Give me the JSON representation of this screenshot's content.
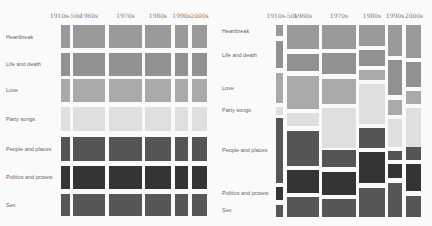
{
  "colors": {
    "Heartbreak": "#9a9a9a",
    "Life and death": "#919191",
    "Love": "#a9a9a9",
    "Party songs": "#dfdfdf",
    "People and places": "#555555",
    "Politics and protest": "#343434",
    "Sex": "#575757"
  },
  "chart_data": [
    {
      "type": "mosaic",
      "title": "",
      "categories": [
        "1910s-50s",
        "1960s",
        "1970s",
        "1980s",
        "1990s",
        "2000s"
      ],
      "rows": [
        "Heartbreak",
        "Life and death",
        "Love",
        "Party songs",
        "People and places",
        "Politics and protest",
        "Sex"
      ],
      "column_widths_px": [
        9,
        32,
        33,
        26,
        13,
        15
      ],
      "note": "Equal row heights (uniform baseline); column width proportional to number of songs per decade",
      "series": [
        {
          "name": "Heartbreak",
          "values": [
            1,
            1,
            1,
            1,
            1,
            1
          ]
        },
        {
          "name": "Life and death",
          "values": [
            1,
            1,
            1,
            1,
            1,
            1
          ]
        },
        {
          "name": "Love",
          "values": [
            1,
            1,
            1,
            1,
            1,
            1
          ]
        },
        {
          "name": "Party songs",
          "values": [
            1,
            1,
            1,
            1,
            1,
            1
          ]
        },
        {
          "name": "People and places",
          "values": [
            1,
            1,
            1,
            1,
            1,
            1
          ]
        },
        {
          "name": "Politics and protest",
          "values": [
            1,
            1,
            1,
            1,
            1,
            1
          ]
        },
        {
          "name": "Sex",
          "values": [
            1,
            1,
            1,
            1,
            1,
            1
          ]
        }
      ]
    },
    {
      "type": "mosaic",
      "title": "",
      "categories": [
        "1910s-50s",
        "1960s",
        "1970s",
        "1980s",
        "1990s",
        "2000s"
      ],
      "rows": [
        "Heartbreak",
        "Life and death",
        "Love",
        "Party songs",
        "People and places",
        "Politics and protest",
        "Sex"
      ],
      "column_widths_px": [
        7,
        32,
        34,
        26,
        14,
        15
      ],
      "note": "Row heights = share of theme within each decade (approx %)",
      "series": [
        {
          "name": "Heartbreak",
          "values": [
            6,
            13,
            13,
            11,
            16,
            17
          ]
        },
        {
          "name": "Life and death",
          "values": [
            15,
            9,
            11,
            9,
            18,
            13
          ]
        },
        {
          "name": "Love",
          "values": [
            16,
            17,
            13,
            5,
            8,
            7
          ]
        },
        {
          "name": "Party songs",
          "values": [
            4,
            7,
            21,
            21,
            15,
            20
          ]
        },
        {
          "name": "People and places",
          "values": [
            34,
            18,
            9,
            10,
            5,
            7
          ]
        },
        {
          "name": "Politics and protest",
          "values": [
            7,
            12,
            12,
            16,
            7,
            14
          ]
        },
        {
          "name": "Sex",
          "values": [
            7,
            11,
            10,
            15,
            18,
            11
          ]
        }
      ]
    }
  ],
  "left": {
    "columns": [
      {
        "label": "1910s-50s",
        "x": 61,
        "w": 9
      },
      {
        "label": "1960s",
        "x": 73,
        "w": 32
      },
      {
        "label": "1970s",
        "x": 109,
        "w": 33
      },
      {
        "label": "1980s",
        "x": 145,
        "w": 26
      },
      {
        "label": "1990s",
        "x": 175,
        "w": 13
      },
      {
        "label": "2000s",
        "x": 192,
        "w": 15
      }
    ],
    "rows": [
      {
        "label": "Heartbreak",
        "label_y": 37,
        "y": 25,
        "h": 23
      },
      {
        "label": "Life and death",
        "label_y": 64,
        "y": 53,
        "h": 23
      },
      {
        "label": "Love",
        "label_y": 90,
        "y": 79,
        "h": 23
      },
      {
        "label": "Party songs",
        "label_y": 119,
        "y": 107,
        "h": 24
      },
      {
        "label": "People and places",
        "label_y": 149,
        "y": 137,
        "h": 24
      },
      {
        "label": "Politics and protest",
        "label_y": 177,
        "y": 166,
        "h": 23
      },
      {
        "label": "Sex",
        "label_y": 205,
        "y": 194,
        "h": 22
      }
    ]
  },
  "right": {
    "columns": [
      {
        "label": "1910s-50s",
        "x": 60,
        "w": 7,
        "label_x": 66,
        "cells": [
          [
            25,
            11
          ],
          [
            41,
            27
          ],
          [
            73,
            30
          ],
          [
            107,
            8
          ],
          [
            118,
            65
          ],
          [
            187,
            13
          ],
          [
            205,
            12
          ]
        ]
      },
      {
        "label": "1960s",
        "x": 71,
        "w": 32,
        "label_x": 87,
        "cells": [
          [
            25,
            24
          ],
          [
            54,
            17
          ],
          [
            76,
            33
          ],
          [
            113,
            13
          ],
          [
            131,
            35
          ],
          [
            170,
            23
          ],
          [
            197,
            20
          ]
        ]
      },
      {
        "label": "1970s",
        "x": 106,
        "w": 34,
        "label_x": 123,
        "cells": [
          [
            25,
            24
          ],
          [
            53,
            21
          ],
          [
            79,
            25
          ],
          [
            108,
            40
          ],
          [
            150,
            17
          ],
          [
            172,
            23
          ],
          [
            199,
            18
          ]
        ]
      },
      {
        "label": "1980s",
        "x": 143,
        "w": 26,
        "label_x": 156,
        "cells": [
          [
            25,
            21
          ],
          [
            50,
            16
          ],
          [
            70,
            10
          ],
          [
            84,
            40
          ],
          [
            128,
            20
          ],
          [
            152,
            31
          ],
          [
            188,
            29
          ]
        ]
      },
      {
        "label": "1990s",
        "x": 172,
        "w": 14,
        "label_x": 179,
        "cells": [
          [
            25,
            31
          ],
          [
            60,
            35
          ],
          [
            100,
            15
          ],
          [
            119,
            28
          ],
          [
            151,
            9
          ],
          [
            164,
            14
          ],
          [
            183,
            34
          ]
        ]
      },
      {
        "label": "2000s",
        "x": 190,
        "w": 15,
        "label_x": 198,
        "cells": [
          [
            25,
            33
          ],
          [
            62,
            25
          ],
          [
            91,
            13
          ],
          [
            108,
            39
          ],
          [
            147,
            13
          ],
          [
            164,
            27
          ],
          [
            196,
            21
          ]
        ]
      }
    ],
    "rows": [
      {
        "label": "Heartbreak",
        "label_y": 31
      },
      {
        "label": "Life and death",
        "label_y": 55
      },
      {
        "label": "Love",
        "label_y": 88
      },
      {
        "label": "Party songs",
        "label_y": 110
      },
      {
        "label": "People and places",
        "label_y": 150
      },
      {
        "label": "Politics and protest",
        "label_y": 193
      },
      {
        "label": "Sex",
        "label_y": 210
      }
    ]
  }
}
